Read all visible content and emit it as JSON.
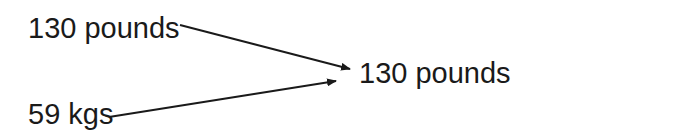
{
  "diagram": {
    "nodes": [
      {
        "id": "top-left",
        "label": "130 pounds"
      },
      {
        "id": "bottom-left",
        "label": "59 kgs"
      },
      {
        "id": "right",
        "label": "130 pounds"
      }
    ],
    "edges": [
      {
        "from": "top-left",
        "to": "right"
      },
      {
        "from": "bottom-left",
        "to": "right"
      }
    ],
    "colors": {
      "ink": "#1a1a1a",
      "background": "#ffffff"
    }
  }
}
